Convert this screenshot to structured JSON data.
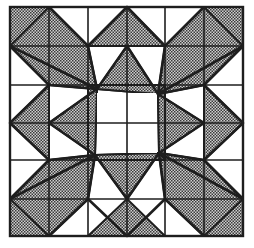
{
  "figure": {
    "title": "",
    "grid": {
      "rows": 6,
      "cols": 6
    },
    "colors": {
      "background": "#ffffff",
      "line": "#1e1e1e",
      "hatch": "#3a3a3a",
      "hatch_bg": "#d8d8d8"
    }
  }
}
